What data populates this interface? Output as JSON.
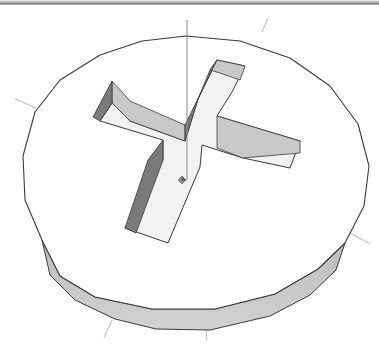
{
  "scene": {
    "description": "Polygonal disc with a cross-shaped recess (Phillips screw head)",
    "colors": {
      "background": "#ffffff",
      "top_face": "#ffffff",
      "outline": "#3a3a3a",
      "side_band": "#d2d2d2",
      "side_band_dark": "#bcbcbc",
      "wall_light": "#c8c8c8",
      "wall_dark": "#7a7a7a",
      "recess_floor": "#f2f2f2",
      "axis_line": "#b8b8b8",
      "axis_vertical": "#8a8a8a"
    },
    "disc_top": [
      [
        186,
        36
      ],
      [
        240,
        41
      ],
      [
        290,
        58
      ],
      [
        330,
        86
      ],
      [
        358,
        124
      ],
      [
        369,
        166
      ],
      [
        364,
        206
      ],
      [
        345,
        243
      ],
      [
        318,
        269
      ],
      [
        275,
        294
      ],
      [
        215,
        309
      ],
      [
        152,
        309
      ],
      [
        95,
        297
      ],
      [
        60,
        276
      ],
      [
        42,
        240
      ],
      [
        25,
        200
      ],
      [
        23,
        156
      ],
      [
        35,
        112
      ],
      [
        60,
        80
      ],
      [
        100,
        55
      ],
      [
        142,
        41
      ]
    ],
    "disc_side": [
      [
        42,
        240
      ],
      [
        60,
        276
      ],
      [
        95,
        297
      ],
      [
        152,
        309
      ],
      [
        215,
        309
      ],
      [
        275,
        294
      ],
      [
        318,
        269
      ],
      [
        345,
        243
      ],
      [
        336,
        270
      ],
      [
        310,
        295
      ],
      [
        270,
        316
      ],
      [
        210,
        330
      ],
      [
        156,
        329
      ],
      [
        115,
        319
      ],
      [
        75,
        300
      ],
      [
        50,
        275
      ]
    ],
    "cross": {
      "floor": [
        [
          217,
          60
        ],
        [
          245,
          66
        ],
        [
          232,
          92
        ],
        [
          217,
          116
        ],
        [
          300,
          141
        ],
        [
          290,
          168
        ],
        [
          243,
          158
        ],
        [
          202,
          145
        ],
        [
          200,
          167
        ],
        [
          168,
          243
        ],
        [
          125,
          228
        ],
        [
          163,
          160
        ],
        [
          163,
          140
        ],
        [
          100,
          121
        ],
        [
          112,
          103
        ],
        [
          130,
          121
        ],
        [
          185,
          141
        ],
        [
          198,
          99
        ]
      ],
      "walls_light": [
        [
          [
            112,
            103
          ],
          [
            130,
            121
          ],
          [
            185,
            141
          ],
          [
            185,
            125
          ],
          [
            130,
            101
          ],
          [
            112,
            81
          ]
        ],
        [
          [
            217,
            60
          ],
          [
            245,
            66
          ],
          [
            240,
            80
          ],
          [
            220,
            73
          ],
          [
            210,
            70
          ]
        ],
        [
          [
            217,
            116
          ],
          [
            300,
            141
          ],
          [
            300,
            153
          ],
          [
            243,
            158
          ],
          [
            217,
            148
          ]
        ]
      ],
      "walls_dark": [
        [
          [
            112,
            81
          ],
          [
            112,
            103
          ],
          [
            100,
            121
          ],
          [
            93,
            117
          ]
        ],
        [
          [
            185,
            125
          ],
          [
            217,
            60
          ],
          [
            210,
            70
          ],
          [
            198,
            99
          ],
          [
            185,
            141
          ]
        ],
        [
          [
            163,
            160
          ],
          [
            163,
            140
          ],
          [
            148,
            160
          ],
          [
            125,
            228
          ],
          [
            136,
            233
          ]
        ]
      ]
    },
    "marker": {
      "x": 182,
      "y": 180,
      "label": "origin-marker"
    },
    "axes": [
      {
        "x1": 187,
        "y1": 20,
        "x2": 187,
        "y2": 180,
        "kind": "vertical"
      },
      {
        "x1": 268,
        "y1": 18,
        "x2": 262,
        "y2": 32,
        "kind": "diagonal"
      },
      {
        "x1": 15,
        "y1": 99,
        "x2": 36,
        "y2": 108,
        "kind": "diagonal"
      },
      {
        "x1": 350,
        "y1": 233,
        "x2": 370,
        "y2": 244,
        "kind": "diagonal"
      },
      {
        "x1": 112,
        "y1": 320,
        "x2": 104,
        "y2": 338,
        "kind": "diagonal"
      },
      {
        "x1": 206,
        "y1": 330,
        "x2": 207,
        "y2": 340,
        "kind": "vertical-tail"
      }
    ]
  }
}
